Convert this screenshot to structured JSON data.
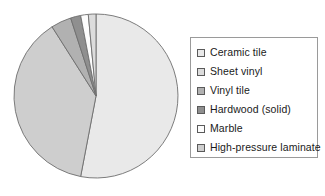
{
  "chart_data": {
    "type": "pie",
    "title": "",
    "subtitle": "",
    "xlabel": "",
    "ylabel": "",
    "grid": false,
    "legend_position": "right",
    "start_angle_deg": 0,
    "direction": "clockwise",
    "categories": [
      "Ceramic tile",
      "Sheet vinyl",
      "Vinyl tile",
      "Hardwood (solid)",
      "Marble",
      "High-pressure laminate"
    ],
    "values": [
      53,
      1.5,
      4,
      2,
      1.5,
      38
    ],
    "colors": [
      "#e9e9e9",
      "#dcdcdc",
      "#b1b1b1",
      "#8f8f8f",
      "#fcfcfc",
      "#cecece"
    ],
    "slices": [
      {
        "label": "Ceramic tile",
        "value": 53,
        "color": "#e9e9e9",
        "start_deg": 0,
        "end_deg": 190.8
      },
      {
        "label": "High-pressure laminate",
        "value": 38,
        "color": "#cecece",
        "start_deg": 190.8,
        "end_deg": 327.6
      },
      {
        "label": "Vinyl tile",
        "value": 4,
        "color": "#b1b1b1",
        "start_deg": 327.6,
        "end_deg": 342.0
      },
      {
        "label": "Hardwood (solid)",
        "value": 2,
        "color": "#8f8f8f",
        "start_deg": 342.0,
        "end_deg": 349.2
      },
      {
        "label": "Marble",
        "value": 1.5,
        "color": "#fcfcfc",
        "start_deg": 349.2,
        "end_deg": 354.6
      },
      {
        "label": "Sheet vinyl",
        "value": 1.5,
        "color": "#dcdcdc",
        "start_deg": 354.6,
        "end_deg": 360.0
      }
    ],
    "geometry": {
      "cx": 83,
      "cy": 83,
      "r": 82
    }
  },
  "legend": {
    "items": [
      {
        "label": "Ceramic tile",
        "color": "#e9e9e9"
      },
      {
        "label": "Sheet vinyl",
        "color": "#dcdcdc"
      },
      {
        "label": "Vinyl tile",
        "color": "#b1b1b1"
      },
      {
        "label": "Hardwood (solid)",
        "color": "#8f8f8f"
      },
      {
        "label": "Marble",
        "color": "#fcfcfc"
      },
      {
        "label": "High-pressure laminate",
        "color": "#cecece"
      }
    ]
  }
}
